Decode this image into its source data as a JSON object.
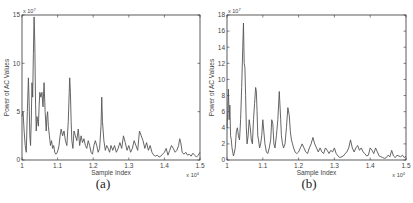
{
  "chart_data": [
    {
      "id": "a",
      "type": "line",
      "caption": "(a)",
      "title": "",
      "xlabel": "Sample Index",
      "ylabel": "Power of AC Values",
      "x_multiplier": "x 10^4",
      "y_multiplier": "x 10^7",
      "xlim": [
        1.0,
        1.5
      ],
      "ylim": [
        0,
        15
      ],
      "xticks": [
        1,
        1.1,
        1.2,
        1.3,
        1.4,
        1.5
      ],
      "xtick_labels": [
        "1",
        "1.1",
        "1.2",
        "1.3",
        "1.4",
        "1.5"
      ],
      "yticks": [
        0,
        5,
        10,
        15
      ],
      "ytick_labels": [
        "0",
        "5",
        "10",
        "15"
      ],
      "grid": false,
      "line_color": "#555555",
      "series": [
        {
          "name": "Power of AC Values",
          "x": [
            1.0,
            1.003,
            1.006,
            1.009,
            1.012,
            1.015,
            1.018,
            1.02,
            1.022,
            1.024,
            1.026,
            1.028,
            1.03,
            1.032,
            1.034,
            1.036,
            1.038,
            1.04,
            1.042,
            1.044,
            1.046,
            1.048,
            1.05,
            1.053,
            1.056,
            1.059,
            1.062,
            1.065,
            1.068,
            1.07,
            1.072,
            1.074,
            1.077,
            1.08,
            1.083,
            1.086,
            1.089,
            1.092,
            1.095,
            1.098,
            1.101,
            1.104,
            1.107,
            1.11,
            1.114,
            1.118,
            1.122,
            1.126,
            1.13,
            1.134,
            1.136,
            1.138,
            1.14,
            1.143,
            1.146,
            1.15,
            1.154,
            1.158,
            1.162,
            1.166,
            1.17,
            1.174,
            1.178,
            1.182,
            1.186,
            1.19,
            1.194,
            1.198,
            1.202,
            1.206,
            1.21,
            1.214,
            1.218,
            1.222,
            1.224,
            1.226,
            1.23,
            1.234,
            1.238,
            1.242,
            1.246,
            1.25,
            1.255,
            1.26,
            1.265,
            1.27,
            1.275,
            1.28,
            1.285,
            1.29,
            1.295,
            1.3,
            1.305,
            1.31,
            1.315,
            1.32,
            1.325,
            1.33,
            1.335,
            1.34,
            1.345,
            1.35,
            1.355,
            1.36,
            1.365,
            1.37,
            1.375,
            1.38,
            1.385,
            1.39,
            1.395,
            1.4,
            1.405,
            1.41,
            1.415,
            1.42,
            1.425,
            1.43,
            1.435,
            1.44,
            1.443,
            1.446,
            1.45,
            1.455,
            1.46,
            1.465,
            1.47,
            1.475,
            1.48,
            1.485,
            1.49,
            1.495,
            1.5
          ],
          "y": [
            4.5,
            5.0,
            3.0,
            1.5,
            0.8,
            5.0,
            8.5,
            6.0,
            2.5,
            1.5,
            4.0,
            8.0,
            6.5,
            11.0,
            14.8,
            12.0,
            6.0,
            3.0,
            4.5,
            4.0,
            3.5,
            5.5,
            7.0,
            6.5,
            7.0,
            5.5,
            8.0,
            5.0,
            3.0,
            4.5,
            5.0,
            3.5,
            2.5,
            1.5,
            2.0,
            1.2,
            1.5,
            0.8,
            0.6,
            0.7,
            1.0,
            1.5,
            2.5,
            3.2,
            2.5,
            3.0,
            2.0,
            1.5,
            4.0,
            8.5,
            7.0,
            4.0,
            2.0,
            1.2,
            3.0,
            2.5,
            2.0,
            3.2,
            1.5,
            2.5,
            1.8,
            2.2,
            1.5,
            1.2,
            2.0,
            1.5,
            0.8,
            0.6,
            1.5,
            2.0,
            1.5,
            0.8,
            1.2,
            3.5,
            6.5,
            4.0,
            2.0,
            1.0,
            1.5,
            1.2,
            0.8,
            1.5,
            1.0,
            1.5,
            0.8,
            1.2,
            1.8,
            1.2,
            2.5,
            1.8,
            1.0,
            1.5,
            0.8,
            1.2,
            2.0,
            1.5,
            1.0,
            3.0,
            2.5,
            2.0,
            1.2,
            1.8,
            1.0,
            1.5,
            0.8,
            0.5,
            0.4,
            0.5,
            0.3,
            0.4,
            0.6,
            0.8,
            1.2,
            0.5,
            1.0,
            1.5,
            1.2,
            0.8,
            1.0,
            1.5,
            2.2,
            1.8,
            0.8,
            0.6,
            0.8,
            0.5,
            0.6,
            0.4,
            0.7,
            0.5,
            0.3,
            0.5,
            0.8
          ]
        }
      ]
    },
    {
      "id": "b",
      "type": "line",
      "caption": "(b)",
      "title": "",
      "xlabel": "Sample Index",
      "ylabel": "Power of AC Values",
      "x_multiplier": "x 10^4",
      "y_multiplier": "x 10^7",
      "xlim": [
        1.0,
        1.5
      ],
      "ylim": [
        0,
        18
      ],
      "xticks": [
        1,
        1.1,
        1.2,
        1.3,
        1.4,
        1.5
      ],
      "xtick_labels": [
        "1",
        "1.1",
        "1.2",
        "1.3",
        "1.4",
        "1.5"
      ],
      "yticks": [
        0,
        2,
        4,
        6,
        8,
        10,
        12,
        14,
        16,
        18
      ],
      "ytick_labels": [
        "0",
        "2",
        "4",
        "6",
        "8",
        "10",
        "12",
        "14",
        "16",
        "18"
      ],
      "grid": false,
      "line_color": "#555555",
      "series": [
        {
          "name": "Power of AC Values",
          "x": [
            1.0,
            1.002,
            1.004,
            1.006,
            1.008,
            1.01,
            1.012,
            1.014,
            1.016,
            1.018,
            1.02,
            1.023,
            1.026,
            1.029,
            1.032,
            1.035,
            1.038,
            1.041,
            1.044,
            1.046,
            1.048,
            1.05,
            1.052,
            1.054,
            1.056,
            1.059,
            1.062,
            1.065,
            1.068,
            1.071,
            1.074,
            1.077,
            1.08,
            1.082,
            1.084,
            1.086,
            1.088,
            1.091,
            1.094,
            1.097,
            1.1,
            1.103,
            1.106,
            1.11,
            1.114,
            1.118,
            1.122,
            1.125,
            1.128,
            1.131,
            1.134,
            1.138,
            1.142,
            1.146,
            1.15,
            1.152,
            1.155,
            1.158,
            1.162,
            1.166,
            1.17,
            1.174,
            1.177,
            1.18,
            1.183,
            1.186,
            1.19,
            1.195,
            1.2,
            1.205,
            1.21,
            1.215,
            1.22,
            1.225,
            1.23,
            1.235,
            1.24,
            1.245,
            1.25,
            1.255,
            1.26,
            1.265,
            1.27,
            1.275,
            1.28,
            1.285,
            1.29,
            1.295,
            1.3,
            1.305,
            1.31,
            1.315,
            1.32,
            1.325,
            1.33,
            1.335,
            1.34,
            1.345,
            1.35,
            1.355,
            1.36,
            1.365,
            1.37,
            1.375,
            1.38,
            1.385,
            1.39,
            1.395,
            1.4,
            1.405,
            1.41,
            1.415,
            1.42,
            1.425,
            1.43,
            1.435,
            1.44,
            1.445,
            1.45,
            1.455,
            1.46,
            1.465,
            1.47,
            1.475,
            1.48,
            1.485,
            1.49,
            1.495,
            1.5
          ],
          "y": [
            4.0,
            6.0,
            8.8,
            5.0,
            6.8,
            3.0,
            2.5,
            1.5,
            1.0,
            0.5,
            0.8,
            1.5,
            3.5,
            4.0,
            3.0,
            2.5,
            5.0,
            9.0,
            14.0,
            17.0,
            12.0,
            11.5,
            8.0,
            4.0,
            2.0,
            3.0,
            5.0,
            4.0,
            2.5,
            2.0,
            5.0,
            7.0,
            9.0,
            8.5,
            6.0,
            3.0,
            2.5,
            1.5,
            2.0,
            3.0,
            5.0,
            3.5,
            2.0,
            1.0,
            0.8,
            1.5,
            2.5,
            5.0,
            4.5,
            2.0,
            1.5,
            3.0,
            5.0,
            8.5,
            5.0,
            3.0,
            2.0,
            1.5,
            2.0,
            4.0,
            6.5,
            5.5,
            3.5,
            2.5,
            2.0,
            1.5,
            1.0,
            0.8,
            1.0,
            1.5,
            2.0,
            1.5,
            1.0,
            0.8,
            1.5,
            2.0,
            2.8,
            2.0,
            1.5,
            1.0,
            1.5,
            1.0,
            0.8,
            1.5,
            1.2,
            0.8,
            1.2,
            1.0,
            1.5,
            0.8,
            0.5,
            0.3,
            0.4,
            0.5,
            0.8,
            1.0,
            1.5,
            2.5,
            1.5,
            1.0,
            1.5,
            1.8,
            1.2,
            1.5,
            1.0,
            0.8,
            0.5,
            0.6,
            1.5,
            1.2,
            0.8,
            1.5,
            1.0,
            0.5,
            0.4,
            0.3,
            0.2,
            0.3,
            0.6,
            0.4,
            1.2,
            0.5,
            0.3,
            0.6,
            0.5,
            0.4,
            0.6,
            0.3,
            0.5
          ]
        }
      ]
    }
  ]
}
